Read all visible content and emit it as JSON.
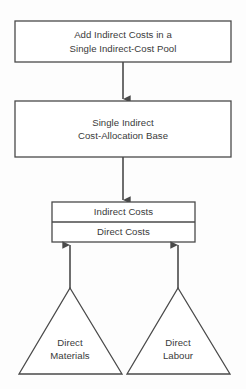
{
  "diagram": {
    "type": "flowchart",
    "stroke_color": "#4a4a4a",
    "text_color": "#3a3a3a",
    "background_color": "#fdfdfd",
    "nodes": {
      "indirect_cost_pool": {
        "shape": "rectangle",
        "line1": "Add Indirect Costs in a",
        "line2": "Single Indirect-Cost Pool"
      },
      "allocation_base": {
        "shape": "rectangle",
        "line1": "Single Indirect",
        "line2": "Cost-Allocation Base"
      },
      "cost_object": {
        "shape": "stacked-rectangle",
        "row_top": "Indirect Costs",
        "row_bottom": "Direct Costs"
      },
      "direct_materials": {
        "shape": "triangle",
        "line1": "Direct",
        "line2": "Materials"
      },
      "direct_labour": {
        "shape": "triangle",
        "line1": "Direct",
        "line2": "Labour"
      }
    },
    "connectors": [
      {
        "name": "pool-to-base",
        "from": "indirect_cost_pool",
        "to": "allocation_base",
        "direction": "down"
      },
      {
        "name": "base-to-cost-object",
        "from": "allocation_base",
        "to": "cost_object",
        "direction": "down"
      },
      {
        "name": "materials-to-cost-object",
        "from": "direct_materials",
        "to": "cost_object",
        "direction": "up"
      },
      {
        "name": "labour-to-cost-object",
        "from": "direct_labour",
        "to": "cost_object",
        "direction": "up"
      }
    ]
  }
}
